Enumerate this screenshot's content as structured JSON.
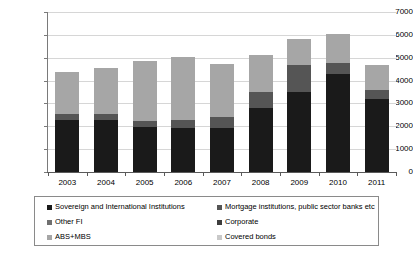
{
  "chart_data": {
    "type": "bar",
    "subtype": "stacked-bar",
    "title": "",
    "xlabel": "",
    "ylabel": "",
    "ylim": [
      0,
      7000
    ],
    "ytick_step": 1000,
    "grid": true,
    "legend_position": "bottom",
    "legend_columns": 2,
    "categories": [
      "2003",
      "2004",
      "2005",
      "2006",
      "2007",
      "2008",
      "2009",
      "2010",
      "2011"
    ],
    "ytick_labels": [
      "7000",
      "6000",
      "5000",
      "4000",
      "3000",
      "2000",
      "1000",
      "0"
    ],
    "ytick_values": [
      7000,
      6000,
      5000,
      4000,
      3000,
      2000,
      1000,
      0
    ],
    "series": [
      {
        "name": "Sovereign and International Institutions",
        "color": "#1a1a1a",
        "values": [
          2260,
          2290,
          1950,
          1930,
          1910,
          2800,
          3500,
          4270,
          3190
        ]
      },
      {
        "name": "Mortgage institutions, public sector banks etc",
        "color": "#555555",
        "values": [
          280,
          250,
          290,
          330,
          480,
          720,
          1180,
          510,
          400
        ]
      },
      {
        "name": "Other FI",
        "color": "#707070",
        "values": [
          0,
          0,
          0,
          0,
          0,
          0,
          0,
          0,
          0
        ]
      },
      {
        "name": "Corporate",
        "color": "#3d3d3d",
        "values": [
          0,
          0,
          0,
          0,
          0,
          0,
          0,
          0,
          0
        ]
      },
      {
        "name": "ABS+MBS",
        "color": "#a6a6a6",
        "values": [
          1840,
          2020,
          2610,
          2760,
          2340,
          1580,
          1130,
          1280,
          1110
        ]
      },
      {
        "name": "Covered bonds",
        "color": "#c9c9c9",
        "values": [
          0,
          0,
          0,
          0,
          0,
          0,
          0,
          0,
          0
        ]
      }
    ],
    "totals": [
      4380,
      4560,
      4850,
      5020,
      4730,
      5100,
      5810,
      6060,
      4700
    ]
  },
  "legend": {
    "items": [
      {
        "label": "Sovereign and International Institutions",
        "color": "#1a1a1a"
      },
      {
        "label": "Mortgage institutions, public sector banks etc",
        "color": "#555555"
      },
      {
        "label": "Other FI",
        "color": "#707070"
      },
      {
        "label": "Corporate",
        "color": "#3d3d3d"
      },
      {
        "label": "ABS+MBS",
        "color": "#a6a6a6"
      },
      {
        "label": "Covered bonds",
        "color": "#c9c9c9"
      }
    ]
  },
  "colors": {
    "gridline": "#d6d6d6",
    "axis": "#5a5a5a",
    "legend_border": "#8a8a8a",
    "background": "#ffffff"
  }
}
